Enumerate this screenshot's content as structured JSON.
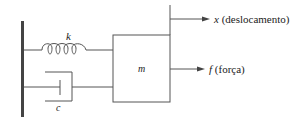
{
  "diagram": {
    "type": "mass-spring-damper",
    "spring_label": "k",
    "damper_label": "c",
    "mass_label": "m",
    "displacement": {
      "symbol": "x",
      "description": "(deslocamento)"
    },
    "force": {
      "symbol": "f",
      "description": "(força)"
    },
    "colors": {
      "line": "#555555",
      "wall": "#444444",
      "text": "#222222"
    }
  }
}
